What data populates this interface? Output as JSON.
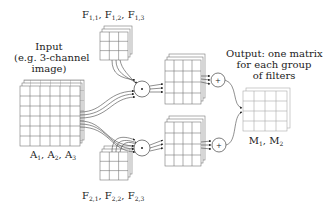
{
  "input": {
    "title_lines": [
      "Input",
      "(e.g. 3-channel",
      "image)"
    ],
    "channels": [
      {
        "name": "A",
        "sub": "1"
      },
      {
        "name": "A",
        "sub": "2"
      },
      {
        "name": "A",
        "sub": "3"
      }
    ]
  },
  "filters_group1": {
    "items": [
      {
        "name": "F",
        "sub": "1,1"
      },
      {
        "name": "F",
        "sub": "1,2"
      },
      {
        "name": "F",
        "sub": "1,3"
      }
    ]
  },
  "filters_group2": {
    "items": [
      {
        "name": "F",
        "sub": "2,1"
      },
      {
        "name": "F",
        "sub": "2,2"
      },
      {
        "name": "F",
        "sub": "2,3"
      }
    ]
  },
  "operators": {
    "convolve_symbol": "*",
    "sum_symbol": "+"
  },
  "output": {
    "title_lines": [
      "Output: one matrix",
      "for each group",
      "of filters"
    ],
    "matrices": [
      {
        "name": "M",
        "sub": "1"
      },
      {
        "name": "M",
        "sub": "2"
      }
    ]
  },
  "colors": {
    "line": "#444444",
    "grid": "#777777",
    "output_grid": "#aaaaaa",
    "background": "#ffffff"
  }
}
